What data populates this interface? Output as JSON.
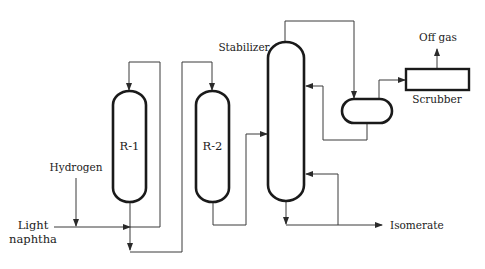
{
  "diagram": {
    "type": "process-flow",
    "colors": {
      "line": "#3a3a3a",
      "vessel": "#1a1a1a",
      "text": "#222222",
      "background": "#ffffff"
    },
    "units": {
      "reactor1": {
        "label": "R-1"
      },
      "reactor2": {
        "label": "R-2"
      },
      "stabilizer": {
        "label": "Stabilizer"
      },
      "scrubber": {
        "label": "Scrubber"
      },
      "drum": {
        "label": ""
      }
    },
    "streams": {
      "hydrogen": {
        "label": "Hydrogen"
      },
      "light_naphtha": {
        "label_line1": "Light",
        "label_line2": "naphtha"
      },
      "off_gas": {
        "label": "Off gas"
      },
      "isomerate": {
        "label": "Isomerate"
      }
    }
  }
}
